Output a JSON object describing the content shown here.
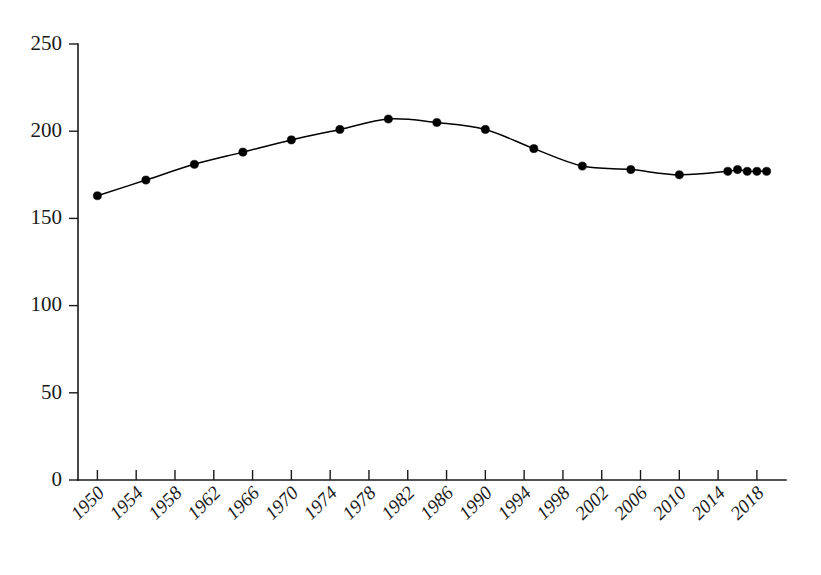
{
  "chart_data": {
    "type": "line",
    "title": "",
    "subtitle": "",
    "xlabel": "",
    "ylabel": "",
    "grid": false,
    "legend": false,
    "legend_position": "none",
    "marker": "filled-circle",
    "line_color": "#000000",
    "marker_color": "#000000",
    "xlim": [
      1948,
      2021
    ],
    "ylim": [
      0,
      250
    ],
    "ytick_labels": [
      "0",
      "50",
      "100",
      "150",
      "200",
      "250"
    ],
    "ytick_values": [
      0,
      50,
      100,
      150,
      200,
      250
    ],
    "xtick_labels": [
      "1950",
      "1954",
      "1958",
      "1962",
      "1966",
      "1970",
      "1974",
      "1978",
      "1982",
      "1986",
      "1990",
      "1994",
      "1998",
      "2002",
      "2006",
      "2010",
      "2014",
      "2018"
    ],
    "xtick_values": [
      1950,
      1954,
      1958,
      1962,
      1966,
      1970,
      1974,
      1978,
      1982,
      1986,
      1990,
      1994,
      1998,
      2002,
      2006,
      2010,
      2014,
      2018
    ],
    "xtick_label_rotation": -45,
    "x": [
      1950,
      1955,
      1960,
      1965,
      1970,
      1975,
      1980,
      1985,
      1990,
      1995,
      2000,
      2005,
      2010,
      2015,
      2016,
      2017,
      2018,
      2019
    ],
    "values": [
      163,
      172,
      181,
      188,
      195,
      201,
      207,
      205,
      201,
      190,
      180,
      178,
      175,
      177,
      178,
      177,
      177,
      177
    ],
    "series": [
      {
        "name": "series-1",
        "x": [
          1950,
          1955,
          1960,
          1965,
          1970,
          1975,
          1980,
          1985,
          1990,
          1995,
          2000,
          2005,
          2010,
          2015,
          2016,
          2017,
          2018,
          2019
        ],
        "values": [
          163,
          172,
          181,
          188,
          195,
          201,
          207,
          205,
          201,
          190,
          180,
          178,
          175,
          177,
          178,
          177,
          177,
          177
        ]
      }
    ]
  }
}
